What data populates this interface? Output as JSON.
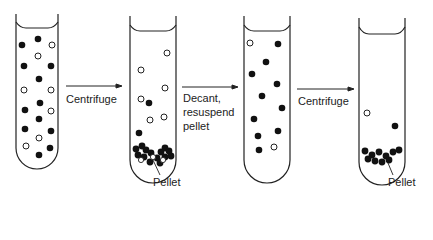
{
  "diagram": {
    "steps": [
      {
        "label": "Centrifuge"
      },
      {
        "label_lines": [
          "Decant,",
          "resuspend",
          "pellet"
        ]
      },
      {
        "label": "Centrifuge"
      }
    ],
    "pellet_labels": [
      "Pellet",
      "Pellet"
    ],
    "legend": {
      "filled": "dense particle",
      "open": "light particle"
    },
    "colors": {
      "stroke": "#222222",
      "fill": "#111111",
      "background": "#ffffff"
    }
  }
}
